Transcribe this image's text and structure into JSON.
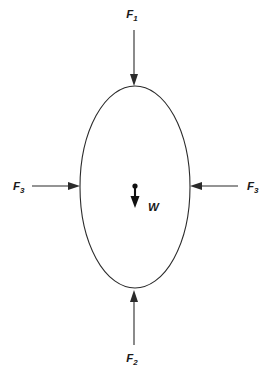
{
  "figure": {
    "type": "free-body-force-diagram",
    "background_color": "#ffffff",
    "stroke_color": "#2b2b2b",
    "text_color": "#1a1a1a",
    "body": {
      "shape": "ellipse",
      "center_x": 135,
      "center_y": 187,
      "radius_x": 55,
      "radius_y": 101
    },
    "center_point": {
      "x": 135,
      "y": 186
    }
  },
  "labels": {
    "force_top": {
      "symbol": "F",
      "subscript": "1",
      "full": "F1",
      "x": 132,
      "y": 18
    },
    "force_bottom": {
      "symbol": "F",
      "subscript": "2",
      "full": "F2",
      "x": 132,
      "y": 362
    },
    "force_left": {
      "symbol": "F",
      "subscript": "3",
      "full": "F3",
      "x": 13,
      "y": 190
    },
    "force_right": {
      "symbol": "F",
      "subscript": "3",
      "full": "F3",
      "x": 247,
      "y": 190
    },
    "weight": {
      "symbol": "W",
      "subscript": "",
      "full": "W",
      "x": 148,
      "y": 211
    }
  },
  "arrows": [
    {
      "name": "force-top-arrow",
      "label": "F1",
      "direction": "down",
      "x1": 134,
      "y1": 30,
      "x2": 134,
      "y2": 86
    },
    {
      "name": "force-bottom-arrow",
      "label": "F2",
      "direction": "up",
      "x1": 134,
      "y1": 345,
      "x2": 134,
      "y2": 290
    },
    {
      "name": "force-left-arrow",
      "label": "F3",
      "direction": "right",
      "x1": 32,
      "y1": 186,
      "x2": 80,
      "y2": 186
    },
    {
      "name": "force-right-arrow",
      "label": "F3",
      "direction": "left",
      "x1": 238,
      "y1": 186,
      "x2": 190,
      "y2": 186
    },
    {
      "name": "weight-arrow",
      "label": "W",
      "direction": "down",
      "x1": 135,
      "y1": 187,
      "x2": 135,
      "y2": 208
    }
  ]
}
